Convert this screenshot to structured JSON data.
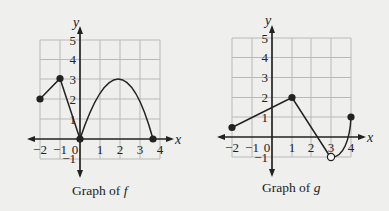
{
  "colors": {
    "background": "#efefed",
    "grid": "#b9b9b9",
    "ink": "#222222"
  },
  "graphs": [
    {
      "id": "f",
      "caption_prefix": "Graph of",
      "caption_var": "f",
      "x_label": "x",
      "y_label": "y",
      "x_ticks": [
        "−2",
        "−1",
        "0",
        "1",
        "2",
        "3",
        "4"
      ],
      "y_ticks": [
        "5",
        "4",
        "3",
        "2",
        "1",
        "−1"
      ],
      "x_range": [
        -2,
        4
      ],
      "y_range": [
        -1,
        5
      ],
      "segments": [
        {
          "type": "line",
          "from": [
            -2,
            2
          ],
          "to": [
            -1,
            3
          ]
        },
        {
          "type": "line",
          "from": [
            -1,
            3
          ],
          "to": [
            0,
            0
          ]
        },
        {
          "type": "parabola",
          "vertex": [
            2,
            3
          ],
          "from": [
            0,
            0
          ],
          "to": [
            3.7,
            0
          ]
        }
      ],
      "points": [
        {
          "x": -2,
          "y": 2,
          "filled": true
        },
        {
          "x": -1,
          "y": 3,
          "filled": true
        },
        {
          "x": 0,
          "y": 0,
          "filled": true
        },
        {
          "x": 3.7,
          "y": 0,
          "filled": true
        }
      ]
    },
    {
      "id": "g",
      "caption_prefix": "Graph of",
      "caption_var": "g",
      "x_label": "x",
      "y_label": "y",
      "x_ticks": [
        "−2",
        "−1",
        "0",
        "1",
        "2",
        "3",
        "4"
      ],
      "y_ticks": [
        "5",
        "4",
        "3",
        "2",
        "1",
        "−1"
      ],
      "x_range": [
        -2,
        4
      ],
      "y_range": [
        -1,
        5
      ],
      "segments": [
        {
          "type": "line",
          "from": [
            -2,
            0.5
          ],
          "to": [
            1,
            2
          ]
        },
        {
          "type": "line",
          "from": [
            1,
            2
          ],
          "to": [
            3,
            -1
          ]
        },
        {
          "type": "curve",
          "from": [
            3,
            -1
          ],
          "to": [
            4,
            1
          ]
        }
      ],
      "points": [
        {
          "x": -2,
          "y": 0.5,
          "filled": true
        },
        {
          "x": 1,
          "y": 2,
          "filled": true
        },
        {
          "x": 3,
          "y": -1,
          "filled": false
        },
        {
          "x": 4,
          "y": 1,
          "filled": true
        }
      ]
    }
  ]
}
